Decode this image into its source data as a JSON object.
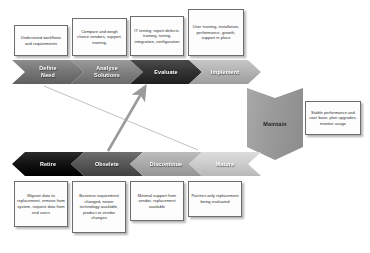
{
  "diagram": {
    "top_phases": [
      {
        "id": "define-need",
        "label": "Define\nNeed",
        "tone": "tone-mid"
      },
      {
        "id": "analyse-solutions",
        "label": "Analyse\nSolutions",
        "tone": "tone-mid2"
      },
      {
        "id": "evaluate",
        "label": "Evaluate",
        "tone": "tone-dark"
      },
      {
        "id": "implement",
        "label": "Implement",
        "tone": "tone-light"
      }
    ],
    "top_callouts": [
      {
        "id": "define-need-note",
        "text": "Understand workflows and requirements"
      },
      {
        "id": "analyse-solutions-note",
        "text": "Compare and weigh choice vendors, support, training,"
      },
      {
        "id": "evaluate-note",
        "text": "IT testing, report defects, training, tuning, integration, configuration"
      },
      {
        "id": "implement-note",
        "text": "User training, installation, performance, growth, support in place"
      }
    ],
    "maintain": {
      "id": "maintain",
      "label": "Maintain",
      "note": "Stable performance and user base, plan upgrades, monitor usage"
    },
    "bottom_phases": [
      {
        "id": "retire",
        "label": "Retire",
        "tone": "tone-black"
      },
      {
        "id": "obselete",
        "label": "Obselete",
        "tone": "tone-dkgray"
      },
      {
        "id": "discontinue",
        "label": "Discontinue",
        "tone": "tone-ltgray"
      },
      {
        "id": "mature",
        "label": "Mature",
        "tone": "tone-pale"
      }
    ],
    "bottom_callouts": [
      {
        "id": "retire-note",
        "text": "Migrate data to replacement, remove from system, request data from end users"
      },
      {
        "id": "obselete-note",
        "text": "Business requirement changed, newer technology available, product or vendor changes"
      },
      {
        "id": "discontinue-note",
        "text": "Minimal support from vendor, replacement available"
      },
      {
        "id": "mature-note",
        "text": "Patches only replacement being evaluated"
      }
    ],
    "connectors": [
      {
        "id": "obselete-to-evaluate",
        "style": "thick-arrow",
        "from": "obselete",
        "to": "evaluate"
      },
      {
        "id": "define-need-to-mature",
        "style": "thin-line",
        "from": "define-need",
        "to": "mature"
      }
    ],
    "colors": {
      "box_border": "#6d6d6d",
      "box_fill": "#fdfdfd",
      "connector": "#9a9a9a",
      "background": "#ffffff"
    }
  }
}
